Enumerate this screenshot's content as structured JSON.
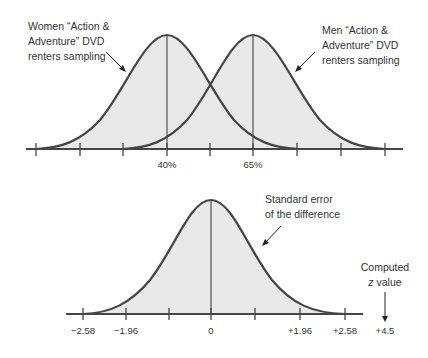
{
  "top_diagram": {
    "women_label": [
      "Women “Action &",
      "Adventure” DVD",
      "renters sampling"
    ],
    "men_label": [
      "Men “Action &",
      "Adventure” DVD",
      "renters sampling"
    ],
    "tick_labels": {
      "women_mean": "40%",
      "men_mean": "65%"
    }
  },
  "bottom_diagram": {
    "curve_label": [
      "Standard error",
      "of the difference"
    ],
    "computed_label": [
      "Computed",
      "z value"
    ],
    "tick_labels": [
      "−2.58",
      "−1.96",
      "0",
      "+1.96",
      "+2.58"
    ],
    "computed_value": "+4.5"
  },
  "colors": {
    "curve": "#454545",
    "fill": "#e9e9e9",
    "axis": "#454545"
  }
}
